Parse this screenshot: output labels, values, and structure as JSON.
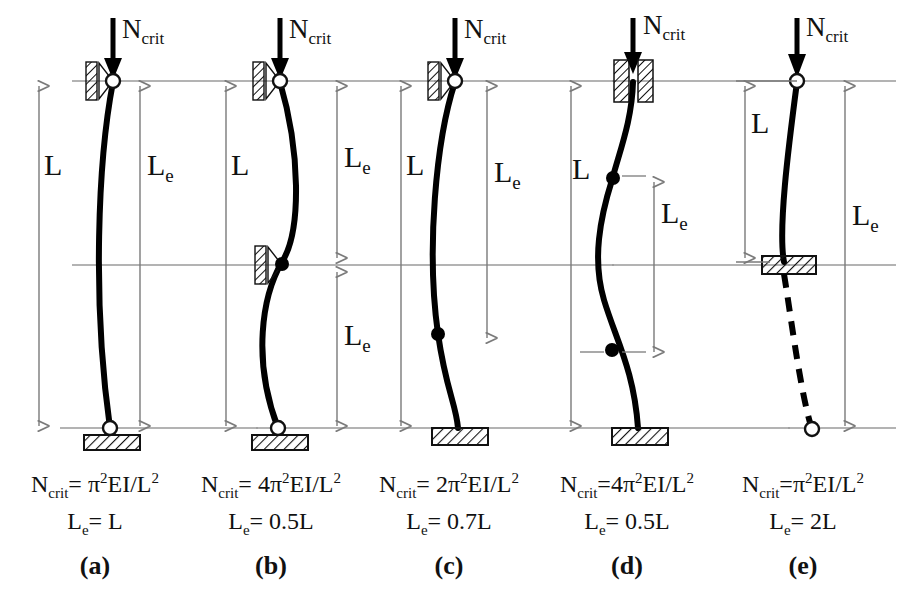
{
  "figure": {
    "load_label": "N",
    "load_sub": "crit",
    "dim_L": "L",
    "dim_Le": "L",
    "dim_Le_sub": "e",
    "line_color": "#000000",
    "guide_color": "#8a8a8a"
  },
  "cases": [
    {
      "id": "a",
      "tag": "(a)",
      "support_top": "roller-pin-horizontal-restraint",
      "support_bottom": "pin-on-ground-block",
      "mode": "half-sine",
      "inflection_points": 0,
      "formula_prefix": "N",
      "formula_sub": "crit",
      "formula_body": "= π",
      "formula_sup": "2",
      "formula_tail": "EI/L",
      "formula_tail_sup": "2",
      "formula_full": "Ncrit= π2EI/L2",
      "le_line_prefix": "L",
      "le_line_sub": "e",
      "le_line_value": "= L",
      "le_value": "L",
      "ncrit_coefficient": "1"
    },
    {
      "id": "b",
      "tag": "(b)",
      "support_top": "roller-pin-horizontal-restraint",
      "support_mid": "roller-pin-horizontal-restraint",
      "support_bottom": "pin-on-ground-block",
      "mode": "full-sine",
      "inflection_points": 1,
      "formula_prefix": "N",
      "formula_sub": "crit",
      "formula_body": "= 4π",
      "formula_sup": "2",
      "formula_tail": "EI/L",
      "formula_tail_sup": "2",
      "formula_full": "Ncrit= 4π2EI/L2",
      "le_line_prefix": "L",
      "le_line_sub": "e",
      "le_line_value": "= 0.5L",
      "le_value": "0.5L",
      "ncrit_coefficient": "4"
    },
    {
      "id": "c",
      "tag": "(c)",
      "support_top": "roller-pin-horizontal-restraint",
      "support_bottom": "fixed-ground-block",
      "mode": "pinned-fixed",
      "inflection_points": 1,
      "formula_prefix": "N",
      "formula_sub": "crit",
      "formula_body": "= 2π",
      "formula_sup": "2",
      "formula_tail": "EI/L",
      "formula_tail_sup": "2",
      "formula_full": "Ncrit= 2π2EI/L2",
      "le_line_prefix": "L",
      "le_line_sub": "e",
      "le_line_value": "= 0.7L",
      "le_value": "0.7L",
      "ncrit_coefficient": "2"
    },
    {
      "id": "d",
      "tag": "(d)",
      "support_top": "guided-fixed-sleeve",
      "support_bottom": "fixed-ground-block",
      "mode": "fixed-fixed",
      "inflection_points": 2,
      "formula_prefix": "N",
      "formula_sub": "crit",
      "formula_body": "=4π",
      "formula_sup": "2",
      "formula_tail": "EI/L",
      "formula_tail_sup": "2",
      "formula_full": "Ncrit=4π2EI/L2",
      "le_line_prefix": "L",
      "le_line_sub": "e",
      "le_line_value": "= 0.5L",
      "le_value": "0.5L",
      "ncrit_coefficient": "4"
    },
    {
      "id": "e",
      "tag": "(e)",
      "support_top": "free-pin-end",
      "support_bottom": "fixed-ground-block-cantilever",
      "mode": "cantilever",
      "inflection_points": 0,
      "mirror": "dashed-mirrored-extension",
      "formula_prefix": "N",
      "formula_sub": "crit",
      "formula_body": "=π",
      "formula_sup": "2",
      "formula_tail": "EI/L",
      "formula_tail_sup": "2",
      "formula_full": "Ncrit=π2EI/L2",
      "le_line_prefix": "L",
      "le_line_sub": "e",
      "le_line_value": "= 2L",
      "le_value": "2L",
      "ncrit_coefficient": "1"
    }
  ]
}
